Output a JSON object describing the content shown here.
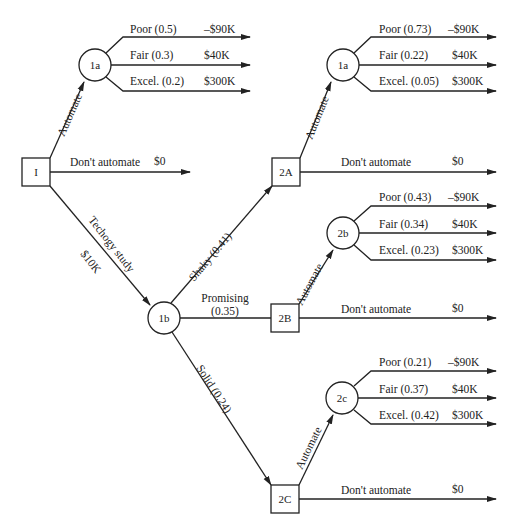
{
  "diagram": {
    "type": "decision-tree",
    "nodes": {
      "I": {
        "label": "I",
        "kind": "decision"
      },
      "n1a_top": {
        "label": "1a",
        "kind": "chance"
      },
      "n1b": {
        "label": "1b",
        "kind": "chance"
      },
      "n2A": {
        "label": "2A",
        "kind": "decision"
      },
      "n1a_right": {
        "label": "1a",
        "kind": "chance"
      },
      "n2B": {
        "label": "2B",
        "kind": "decision"
      },
      "n2b": {
        "label": "2b",
        "kind": "chance"
      },
      "n2C": {
        "label": "2C",
        "kind": "decision"
      },
      "n2c": {
        "label": "2c",
        "kind": "chance"
      }
    },
    "edges": {
      "I_automate": "Automate",
      "I_dont": "Don't automate",
      "I_dont_value": "$0",
      "I_study": "Techogy study",
      "I_study_cost": "$10K",
      "shaky": "Shaky (0.41)",
      "promising_1": "Promising",
      "promising_2": "(0.35)",
      "solid": "Solid (0.24)",
      "A_automate": "Automate",
      "A_dont": "Don't automate",
      "A_dont_value": "$0",
      "B_automate": "Automate",
      "B_dont": "Don't automate",
      "B_dont_value": "$0",
      "C_automate": "Automate",
      "C_dont": "Don't automate",
      "C_dont_value": "$0"
    },
    "outcomes": {
      "top": [
        {
          "label": "Poor (0.5)",
          "value": "–$90K"
        },
        {
          "label": "Fair (0.3)",
          "value": "$40K"
        },
        {
          "label": "Excel. (0.2)",
          "value": "$300K"
        }
      ],
      "shaky": [
        {
          "label": "Poor (0.73)",
          "value": "–$90K"
        },
        {
          "label": "Fair (0.22)",
          "value": "$40K"
        },
        {
          "label": "Excel. (0.05)",
          "value": "$300K"
        }
      ],
      "promising": [
        {
          "label": "Poor (0.43)",
          "value": "–$90K"
        },
        {
          "label": "Fair (0.34)",
          "value": "$40K"
        },
        {
          "label": "Excel. (0.23)",
          "value": "$300K"
        }
      ],
      "solid": [
        {
          "label": "Poor (0.21)",
          "value": "–$90K"
        },
        {
          "label": "Fair (0.37)",
          "value": "$40K"
        },
        {
          "label": "Excel. (0.42)",
          "value": "$300K"
        }
      ]
    }
  }
}
